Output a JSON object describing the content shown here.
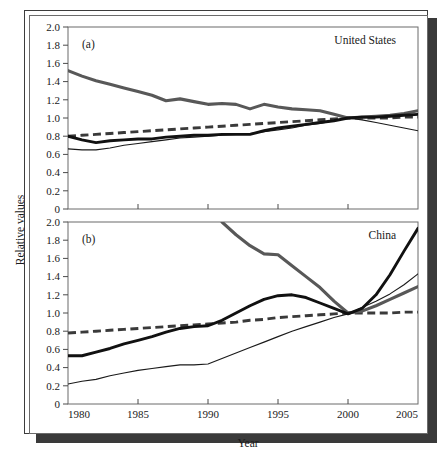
{
  "figure": {
    "axis": {
      "xlabel": "Year",
      "ylabel": "Relative values"
    },
    "panels": [
      {
        "tag": "(a)",
        "region": "United States"
      },
      {
        "tag": "(b)",
        "region": "China"
      }
    ],
    "yticks": [
      "2.0",
      "1.8",
      "1.6",
      "1.4",
      "1.2",
      "1.0",
      "0.8",
      "0.6",
      "0.4",
      "0.2",
      "0"
    ],
    "xticks": [
      "1980",
      "1985",
      "1990",
      "1995",
      "2000",
      "2005"
    ]
  },
  "chart_data": {
    "type": "line",
    "title": "",
    "xlabel": "Year",
    "ylabel": "Relative values",
    "xlim": [
      1980,
      2005
    ],
    "ylim": [
      0,
      2.0
    ],
    "yticks": [
      0,
      0.2,
      0.4,
      0.6,
      0.8,
      1.0,
      1.2,
      1.4,
      1.6,
      1.8,
      2.0
    ],
    "xticks": [
      1980,
      1985,
      1990,
      1995,
      2000,
      2005
    ],
    "grid": false,
    "legend": "none",
    "panels": [
      {
        "tag": "(a)",
        "region": "United States",
        "annotations": [
          "(a)",
          "United States"
        ],
        "x": [
          1980,
          1981,
          1982,
          1983,
          1984,
          1985,
          1986,
          1987,
          1988,
          1989,
          1990,
          1991,
          1992,
          1993,
          1994,
          1995,
          1996,
          1997,
          1998,
          1999,
          2000,
          2001,
          2002,
          2003,
          2004,
          2005
        ],
        "series": [
          {
            "name": "gray-thick",
            "style": "gray solid thick",
            "values": [
              1.52,
              1.46,
              1.41,
              1.37,
              1.33,
              1.29,
              1.25,
              1.19,
              1.21,
              1.18,
              1.15,
              1.16,
              1.15,
              1.1,
              1.15,
              1.12,
              1.1,
              1.09,
              1.08,
              1.04,
              1.0,
              1.01,
              1.02,
              1.03,
              1.05,
              1.08
            ]
          },
          {
            "name": "black-thick",
            "style": "black solid thick",
            "values": [
              0.8,
              0.76,
              0.73,
              0.75,
              0.76,
              0.77,
              0.77,
              0.79,
              0.8,
              0.81,
              0.81,
              0.82,
              0.82,
              0.82,
              0.86,
              0.89,
              0.91,
              0.93,
              0.95,
              0.97,
              1.0,
              1.01,
              1.01,
              1.02,
              1.03,
              1.04
            ]
          },
          {
            "name": "black-thin",
            "style": "black solid thin",
            "values": [
              0.66,
              0.65,
              0.65,
              0.67,
              0.7,
              0.72,
              0.74,
              0.76,
              0.78,
              0.79,
              0.8,
              0.81,
              0.82,
              0.83,
              0.85,
              0.87,
              0.89,
              0.92,
              0.94,
              0.97,
              1.0,
              0.98,
              0.95,
              0.92,
              0.89,
              0.86
            ]
          },
          {
            "name": "dashed",
            "style": "black dashed thick",
            "values": [
              0.8,
              0.81,
              0.82,
              0.83,
              0.84,
              0.85,
              0.86,
              0.87,
              0.88,
              0.89,
              0.9,
              0.91,
              0.92,
              0.93,
              0.94,
              0.95,
              0.96,
              0.97,
              0.98,
              0.99,
              1.0,
              1.0,
              1.0,
              1.0,
              1.01,
              1.01
            ]
          }
        ]
      },
      {
        "tag": "(b)",
        "region": "China",
        "annotations": [
          "(b)",
          "China"
        ],
        "x": [
          1980,
          1981,
          1982,
          1983,
          1984,
          1985,
          1986,
          1987,
          1988,
          1989,
          1990,
          1991,
          1992,
          1993,
          1994,
          1995,
          1996,
          1997,
          1998,
          1999,
          2000,
          2001,
          2002,
          2003,
          2004,
          2005
        ],
        "series": [
          {
            "name": "gray-thick",
            "style": "gray solid thick",
            "comment": "enters top of panel near 1991 at 2.0",
            "values": [
              null,
              null,
              null,
              null,
              null,
              null,
              null,
              null,
              null,
              null,
              null,
              2.0,
              1.86,
              1.74,
              1.65,
              1.64,
              1.52,
              1.4,
              1.28,
              1.13,
              1.0,
              1.02,
              1.08,
              1.15,
              1.22,
              1.29
            ]
          },
          {
            "name": "black-thick",
            "style": "black solid thick",
            "values": [
              0.53,
              0.53,
              0.57,
              0.61,
              0.66,
              0.7,
              0.74,
              0.79,
              0.83,
              0.85,
              0.86,
              0.92,
              1.0,
              1.08,
              1.15,
              1.19,
              1.2,
              1.17,
              1.11,
              1.05,
              0.99,
              1.05,
              1.2,
              1.42,
              1.68,
              1.93
            ]
          },
          {
            "name": "black-thin",
            "style": "black solid thin",
            "values": [
              0.22,
              0.25,
              0.27,
              0.31,
              0.34,
              0.37,
              0.39,
              0.41,
              0.43,
              0.43,
              0.44,
              0.5,
              0.56,
              0.62,
              0.68,
              0.74,
              0.8,
              0.85,
              0.9,
              0.95,
              0.99,
              1.06,
              1.13,
              1.21,
              1.31,
              1.43
            ]
          },
          {
            "name": "dashed",
            "style": "black dashed thick",
            "values": [
              0.78,
              0.79,
              0.8,
              0.81,
              0.82,
              0.83,
              0.84,
              0.85,
              0.86,
              0.87,
              0.88,
              0.89,
              0.9,
              0.92,
              0.93,
              0.95,
              0.96,
              0.97,
              0.98,
              0.99,
              1.0,
              1.0,
              1.0,
              1.0,
              1.01,
              1.01
            ]
          }
        ]
      }
    ]
  }
}
